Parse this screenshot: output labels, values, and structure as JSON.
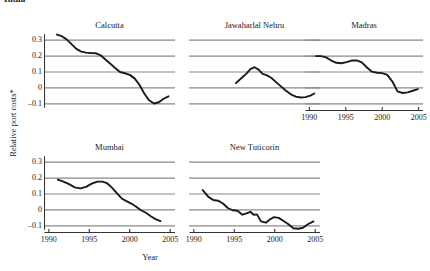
{
  "header": {
    "clipped_title": "India"
  },
  "axes": {
    "ylabel": "Relative port costs*",
    "xlabel": "Year",
    "ytick_labels": [
      "0.3",
      "0.2",
      "0.1",
      "0",
      "–0.1"
    ],
    "ytick_values": [
      0.3,
      0.2,
      0.1,
      0,
      -0.1
    ],
    "xtick_labels": [
      "1990",
      "1995",
      "2000",
      "2005"
    ],
    "xtick_values": [
      1990,
      1995,
      2000,
      2005
    ],
    "ylim": [
      -0.145,
      0.345
    ],
    "xlim": [
      1989.4,
      2005.6
    ],
    "grid": "horizontal"
  },
  "colors": {
    "line": "#1a1a1a",
    "grid": "#8a8a8a",
    "axis": "#333333",
    "background": "#ffffff"
  },
  "chart_data": {
    "type": "line",
    "xlabel": "Year",
    "ylabel": "Relative port costs*",
    "xlim": [
      1989.4,
      2005.6
    ],
    "ylim": [
      -0.145,
      0.345
    ],
    "grid": true,
    "legend": "none",
    "layout": "small multiples, 3 columns x 2 rows",
    "panels": [
      {
        "name": "Calcutta",
        "row": 0,
        "col": 0,
        "x_axis_shown": false,
        "y_axis_shown": true,
        "x": [
          1991.0,
          1991.6,
          1992.2,
          1992.8,
          1993.4,
          1994.0,
          1994.6,
          1995.2,
          1995.8,
          1996.4,
          1997.0,
          1997.6,
          1998.2,
          1998.8,
          1999.4,
          2000.0,
          2000.6,
          2001.2,
          2001.8,
          2002.4,
          2003.0,
          2003.6,
          2004.2,
          2004.8
        ],
        "y": [
          0.335,
          0.325,
          0.305,
          0.275,
          0.245,
          0.228,
          0.222,
          0.219,
          0.218,
          0.205,
          0.178,
          0.152,
          0.125,
          0.1,
          0.092,
          0.082,
          0.06,
          0.02,
          -0.035,
          -0.078,
          -0.098,
          -0.09,
          -0.068,
          -0.053
        ]
      },
      {
        "name": "Jawaharlal Nehru",
        "row": 0,
        "col": 1,
        "x_axis_shown": false,
        "y_axis_shown": false,
        "x": [
          1995.2,
          1995.9,
          1996.5,
          1997.0,
          1997.5,
          1998.0,
          1998.5,
          1999.0,
          1999.6,
          2000.2,
          2000.8,
          2001.4,
          2002.0,
          2002.6,
          2003.2,
          2003.8,
          2004.4,
          2004.9
        ],
        "y": [
          0.03,
          0.062,
          0.09,
          0.118,
          0.13,
          0.115,
          0.088,
          0.08,
          0.062,
          0.035,
          0.008,
          -0.018,
          -0.04,
          -0.055,
          -0.06,
          -0.058,
          -0.048,
          -0.035
        ]
      },
      {
        "name": "Madras",
        "row": 0,
        "col": 2,
        "x_axis_shown": true,
        "y_axis_shown": false,
        "x": [
          1990.9,
          1991.6,
          1992.3,
          1993.0,
          1993.7,
          1994.4,
          1995.1,
          1995.8,
          1996.5,
          1997.2,
          1997.9,
          1998.6,
          1999.3,
          2000.0,
          2000.7,
          2001.4,
          2002.1,
          2002.8,
          2003.5,
          2004.2,
          2004.9
        ],
        "y": [
          0.2,
          0.2,
          0.192,
          0.172,
          0.158,
          0.155,
          0.162,
          0.172,
          0.173,
          0.16,
          0.128,
          0.102,
          0.095,
          0.093,
          0.082,
          0.04,
          -0.022,
          -0.032,
          -0.028,
          -0.018,
          -0.008
        ]
      },
      {
        "name": "Mumbai",
        "row": 1,
        "col": 0,
        "x_axis_shown": true,
        "y_axis_shown": true,
        "x": [
          1991.1,
          1991.8,
          1992.5,
          1993.2,
          1993.9,
          1994.6,
          1995.3,
          1996.0,
          1996.6,
          1997.2,
          1997.8,
          1998.4,
          1999.0,
          1999.6,
          2000.2,
          2000.8,
          2001.4,
          2002.0,
          2002.6,
          2003.2,
          2003.8
        ],
        "y": [
          0.19,
          0.178,
          0.162,
          0.142,
          0.135,
          0.145,
          0.165,
          0.178,
          0.178,
          0.168,
          0.14,
          0.105,
          0.072,
          0.055,
          0.04,
          0.02,
          -0.002,
          -0.018,
          -0.04,
          -0.058,
          -0.07
        ]
      },
      {
        "name": "New Tuticorin",
        "row": 1,
        "col": 1,
        "x_axis_shown": true,
        "y_axis_shown": false,
        "x": [
          1991.1,
          1991.8,
          1992.4,
          1993.0,
          1993.6,
          1994.2,
          1994.8,
          1995.4,
          1996.0,
          1996.5,
          1997.0,
          1997.4,
          1997.8,
          1998.3,
          1998.9,
          1999.4,
          1999.9,
          2000.5,
          2001.1,
          2001.7,
          2002.3,
          2002.9,
          2003.5,
          2004.1,
          2004.8
        ],
        "y": [
          0.125,
          0.082,
          0.062,
          0.058,
          0.04,
          0.012,
          -0.002,
          -0.005,
          -0.03,
          -0.022,
          -0.012,
          -0.03,
          -0.028,
          -0.072,
          -0.08,
          -0.06,
          -0.045,
          -0.05,
          -0.07,
          -0.09,
          -0.115,
          -0.118,
          -0.112,
          -0.09,
          -0.072
        ]
      }
    ],
    "footnote_marker": "*"
  }
}
